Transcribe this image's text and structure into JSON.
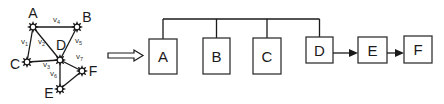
{
  "graph": {
    "nodes": [
      {
        "id": "A",
        "label": "A"
      },
      {
        "id": "B",
        "label": "B"
      },
      {
        "id": "C",
        "label": "C"
      },
      {
        "id": "D",
        "label": "D"
      },
      {
        "id": "E",
        "label": "E"
      },
      {
        "id": "F",
        "label": "F"
      }
    ],
    "edges": [
      {
        "from": "A",
        "to": "B",
        "label": "v",
        "sub": "4"
      },
      {
        "from": "A",
        "to": "C",
        "label": "v",
        "sub": "1"
      },
      {
        "from": "A",
        "to": "D",
        "label": "v",
        "sub": "2"
      },
      {
        "from": "B",
        "to": "D",
        "label": "v",
        "sub": "5"
      },
      {
        "from": "C",
        "to": "D",
        "label": "v",
        "sub": "3"
      },
      {
        "from": "D",
        "to": "F",
        "label": "v",
        "sub": "7"
      },
      {
        "from": "D",
        "to": "E",
        "label": "v",
        "sub": "6"
      },
      {
        "from": "E",
        "to": "F",
        "label": "",
        "sub": ""
      }
    ]
  },
  "transform_arrow": {
    "style": "hollow"
  },
  "flow": {
    "boxes": [
      {
        "id": "A",
        "label": "A"
      },
      {
        "id": "B",
        "label": "B"
      },
      {
        "id": "C",
        "label": "C"
      },
      {
        "id": "D",
        "label": "D"
      },
      {
        "id": "E",
        "label": "E"
      },
      {
        "id": "F",
        "label": "F"
      }
    ],
    "bus_members": [
      "A",
      "B",
      "C",
      "D"
    ],
    "chain": [
      [
        "D",
        "E"
      ],
      [
        "E",
        "F"
      ]
    ]
  },
  "colors": {
    "stroke": "#1a1a1a",
    "background": "#ffffff"
  }
}
